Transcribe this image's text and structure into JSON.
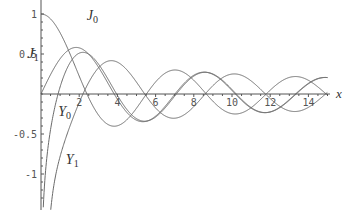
{
  "chart_data": {
    "type": "line",
    "title": "",
    "xlabel": "x",
    "ylabel": "",
    "xlim": [
      0,
      15
    ],
    "ylim": [
      -1.3,
      1.05
    ],
    "grid": false,
    "x_ticks": [
      2,
      4,
      6,
      8,
      10,
      12,
      14
    ],
    "y_ticks": [
      -1,
      -0.5,
      0.5,
      1
    ],
    "y_tick_labels": [
      "-1",
      "-0.5",
      "0.5",
      "1"
    ],
    "series": [
      {
        "name": "J0",
        "label": "J",
        "sub": "0",
        "function": "BesselJ(0,x)",
        "x_range": [
          0,
          15
        ]
      },
      {
        "name": "J1",
        "label": "J",
        "sub": "1",
        "function": "BesselJ(1,x)",
        "x_range": [
          0,
          15
        ]
      },
      {
        "name": "Y0",
        "label": "Y",
        "sub": "0",
        "function": "BesselY(0,x)",
        "x_range": [
          0.1,
          15
        ]
      },
      {
        "name": "Y1",
        "label": "Y",
        "sub": "1",
        "function": "BesselY(1,x)",
        "x_range": [
          0.45,
          15
        ]
      }
    ],
    "sample_points": {
      "x": [
        0,
        1,
        2,
        3,
        4,
        5,
        6,
        7,
        8,
        9,
        10,
        11,
        12,
        13,
        14,
        15
      ],
      "J0": [
        1.0,
        0.765,
        0.224,
        -0.26,
        -0.397,
        -0.178,
        0.151,
        0.3,
        0.172,
        -0.09,
        -0.246,
        -0.171,
        0.048,
        0.207,
        0.171,
        -0.014
      ],
      "J1": [
        0.0,
        0.44,
        0.577,
        0.339,
        -0.066,
        -0.328,
        -0.277,
        -0.005,
        0.235,
        0.245,
        0.043,
        -0.177,
        -0.223,
        -0.07,
        0.133,
        0.205
      ],
      "Y0": [
        null,
        0.088,
        0.51,
        0.377,
        -0.017,
        -0.309,
        -0.288,
        -0.026,
        0.224,
        0.25,
        0.056,
        -0.169,
        -0.225,
        -0.079,
        0.127,
        0.206
      ],
      "Y1": [
        null,
        -0.781,
        -0.107,
        0.325,
        0.398,
        0.148,
        -0.175,
        -0.303,
        -0.158,
        0.104,
        0.249,
        0.164,
        -0.057,
        -0.21,
        -0.167,
        0.021
      ]
    },
    "annotations": [
      {
        "text": "J0",
        "x": 2.4,
        "y": 0.93
      },
      {
        "text": "J1",
        "x": -0.7,
        "y": 0.45
      },
      {
        "text": "Y0",
        "x": 0.9,
        "y": -0.28
      },
      {
        "text": "Y1",
        "x": 1.3,
        "y": -0.88
      }
    ]
  },
  "colors": {
    "curve": "#6a6a6a",
    "axis": "#555555",
    "background": "#ffffff"
  }
}
